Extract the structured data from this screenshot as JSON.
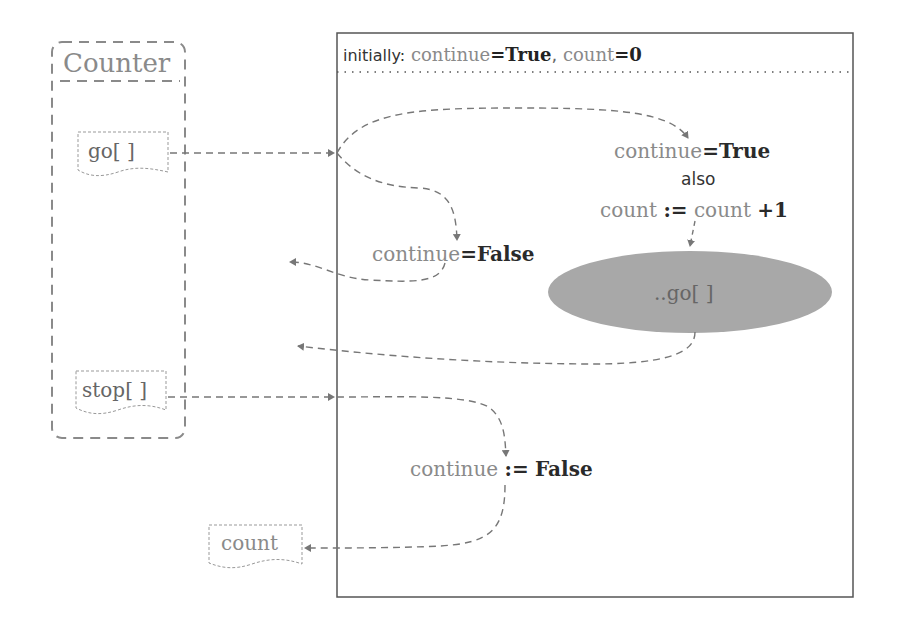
{
  "component": {
    "title": "Counter",
    "inputs": [
      {
        "label": "go[ ]"
      },
      {
        "label": "stop[ ]"
      }
    ],
    "outputs": [
      {
        "label": "count"
      }
    ]
  },
  "state_box": {
    "initial_label": "initially:",
    "initial_var1": "continue",
    "initial_eq1": "=",
    "initial_val1": "True",
    "initial_sep": ",",
    "initial_var2": "count",
    "initial_eq2": "=",
    "initial_val2": "0"
  },
  "go_branch_true": {
    "var": "continue",
    "op": "=",
    "val": "True",
    "connector": "also",
    "assign_var": "count",
    "assign_op": ":=",
    "assign_expr_var": "count",
    "assign_expr_rest": "+1"
  },
  "go_branch_false": {
    "var": "continue",
    "op": "=",
    "val": "False"
  },
  "self_message": {
    "label": "..go[ ]",
    "fill_color": "#a8a8a8"
  },
  "stop_branch": {
    "var": "continue",
    "op": ":=",
    "val": "False"
  },
  "colors": {
    "line": "#777777",
    "box_border": "#555555",
    "text_grey": "#8a8a8a",
    "text_dark": "#2a2a2a"
  }
}
